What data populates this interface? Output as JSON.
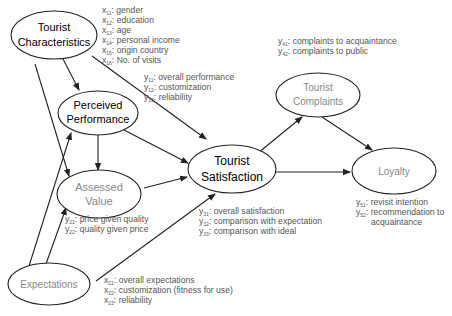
{
  "diagram": {
    "nodes": {
      "tourist_characteristics": {
        "line1": "Tourist",
        "line2": "Characteristics",
        "color": "#222222"
      },
      "perceived_performance": {
        "line1": "Perceived",
        "line2": "Performance",
        "color": "#333333"
      },
      "assessed_value": {
        "line1": "Assessed",
        "line2": "Value",
        "color": "#888888"
      },
      "tourist_satisfaction": {
        "line1": "Tourist",
        "line2": "Satisfaction",
        "color": "#222222"
      },
      "tourist_complaints": {
        "line1": "Tourist",
        "line2": "Complaints",
        "color": "#888888"
      },
      "loyalty": {
        "line1": "Loyalty",
        "color": "#888888"
      },
      "expectations": {
        "line1": "Expectations",
        "color": "#888888"
      }
    },
    "indicators": {
      "tourist_characteristics": [
        {
          "var": "x",
          "sub": "11",
          "label": ": gender"
        },
        {
          "var": "x",
          "sub": "12",
          "label": ": education"
        },
        {
          "var": "x",
          "sub": "13",
          "label": ": age"
        },
        {
          "var": "x",
          "sub": "14",
          "label": ": personal income"
        },
        {
          "var": "x",
          "sub": "15",
          "label": ": origin country"
        },
        {
          "var": "x",
          "sub": "16",
          "label": ": No. of visits"
        }
      ],
      "perceived_performance": [
        {
          "var": "y",
          "sub": "11",
          "label": ": overall performance"
        },
        {
          "var": "y",
          "sub": "12",
          "label": ": customization"
        },
        {
          "var": "y",
          "sub": "13",
          "label": ": reliability"
        }
      ],
      "assessed_value": [
        {
          "var": "y",
          "sub": "21",
          "label": ": price given quality"
        },
        {
          "var": "y",
          "sub": "22",
          "label": ": quality given price"
        }
      ],
      "tourist_satisfaction": [
        {
          "var": "y",
          "sub": "31",
          "label": ": overall satisfaction"
        },
        {
          "var": "y",
          "sub": "32",
          "label": ": comparison with expectation"
        },
        {
          "var": "y",
          "sub": "33",
          "label": ": comparison with ideal"
        }
      ],
      "tourist_complaints": [
        {
          "var": "y",
          "sub": "41",
          "label": ": complaints to acquaintance"
        },
        {
          "var": "y",
          "sub": "42",
          "label": ": complaints to public"
        }
      ],
      "loyalty": [
        {
          "var": "y",
          "sub": "51",
          "label": ": revisit intention"
        },
        {
          "var": "y",
          "sub": "52",
          "label": ": recommendation to"
        },
        {
          "var": "",
          "sub": "",
          "label": "acquaintance"
        }
      ],
      "expectations": [
        {
          "var": "x",
          "sub": "21",
          "label": ": overall expectations"
        },
        {
          "var": "x",
          "sub": "22",
          "label": ": customization (fitness for use)"
        },
        {
          "var": "x",
          "sub": "23",
          "label": ": reliability"
        }
      ]
    },
    "edges": [
      {
        "from": "Tourist Characteristics",
        "to": "Perceived Performance"
      },
      {
        "from": "Tourist Characteristics",
        "to": "Assessed Value"
      },
      {
        "from": "Tourist Characteristics",
        "to": "Tourist Satisfaction"
      },
      {
        "from": "Perceived Performance",
        "to": "Assessed Value"
      },
      {
        "from": "Perceived Performance",
        "to": "Tourist Satisfaction"
      },
      {
        "from": "Assessed Value",
        "to": "Tourist Satisfaction"
      },
      {
        "from": "Expectations",
        "to": "Perceived Performance"
      },
      {
        "from": "Expectations",
        "to": "Assessed Value"
      },
      {
        "from": "Expectations",
        "to": "Tourist Satisfaction"
      },
      {
        "from": "Tourist Satisfaction",
        "to": "Tourist Complaints"
      },
      {
        "from": "Tourist Satisfaction",
        "to": "Loyalty"
      },
      {
        "from": "Tourist Complaints",
        "to": "Loyalty"
      }
    ]
  }
}
